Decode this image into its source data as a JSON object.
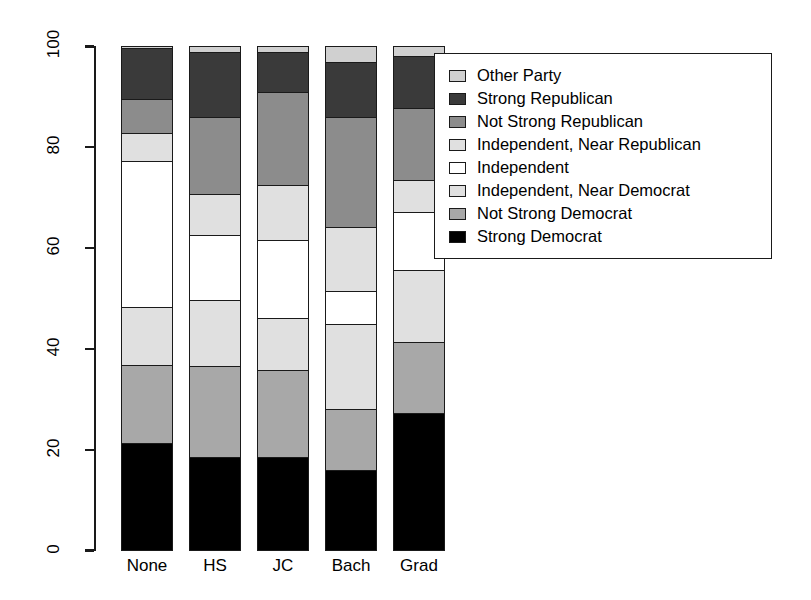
{
  "chart_data": {
    "type": "bar",
    "subtype": "stacked-100-percent",
    "title": "",
    "xlabel": "",
    "ylabel": "",
    "ylim": [
      0,
      100
    ],
    "yticks": [
      0,
      20,
      40,
      60,
      80,
      100
    ],
    "ytick_labels": [
      "0",
      "20",
      "40",
      "60",
      "80",
      "100"
    ],
    "grid": false,
    "legend_position": "top-right",
    "categories": [
      "None",
      "HS",
      "JC",
      "Bach",
      "Grad"
    ],
    "series": [
      {
        "name": "Strong Democrat",
        "color": "#000000",
        "values": [
          21.4,
          18.6,
          18.6,
          16.0,
          27.9
        ]
      },
      {
        "name": "Not Strong Democrat",
        "color": "#a8a8a8",
        "values": [
          15.4,
          18.0,
          17.2,
          12.1,
          14.5
        ]
      },
      {
        "name": "Independent, Near Democrat",
        "color": "#e0e0e0",
        "values": [
          11.5,
          13.1,
          10.3,
          16.8,
          14.5
        ]
      },
      {
        "name": "Independent",
        "color": "#ffffff",
        "values": [
          29.3,
          13.1,
          15.6,
          6.5,
          11.7
        ]
      },
      {
        "name": "Independent, Near Republican",
        "color": "#e0e0e0",
        "values": [
          5.5,
          7.9,
          10.9,
          12.7,
          6.5
        ]
      },
      {
        "name": "Not Strong Republican",
        "color": "#8c8c8c",
        "values": [
          6.7,
          15.4,
          18.6,
          22.0,
          14.5
        ]
      },
      {
        "name": "Strong Republican",
        "color": "#3a3a3a",
        "values": [
          9.9,
          12.9,
          7.7,
          10.9,
          10.5
        ]
      },
      {
        "name": "Other Party",
        "color": "#d0d0d0",
        "values": [
          0.3,
          1.0,
          1.1,
          3.0,
          1.9
        ]
      }
    ]
  },
  "legend": {
    "items": [
      {
        "label": "Other Party",
        "swatch": "#d0d0d0"
      },
      {
        "label": "Strong Republican",
        "swatch": "#3a3a3a"
      },
      {
        "label": "Not Strong Republican",
        "swatch": "#8c8c8c"
      },
      {
        "label": "Independent, Near Republican",
        "swatch": "#e0e0e0"
      },
      {
        "label": "Independent",
        "swatch": "#ffffff"
      },
      {
        "label": "Independent, Near Democrat",
        "swatch": "#e0e0e0"
      },
      {
        "label": "Not Strong Democrat",
        "swatch": "#a8a8a8"
      },
      {
        "label": "Strong Democrat",
        "swatch": "#000000"
      }
    ]
  },
  "axis": {
    "y_ticks": [
      "100",
      "80",
      "60",
      "40",
      "20",
      "0"
    ]
  },
  "x_labels": [
    "None",
    "HS",
    "JC",
    "Bach",
    "Grad"
  ],
  "colors": {
    "axis": "#1a1a1a",
    "background": "#ffffff",
    "text": "#000000"
  }
}
